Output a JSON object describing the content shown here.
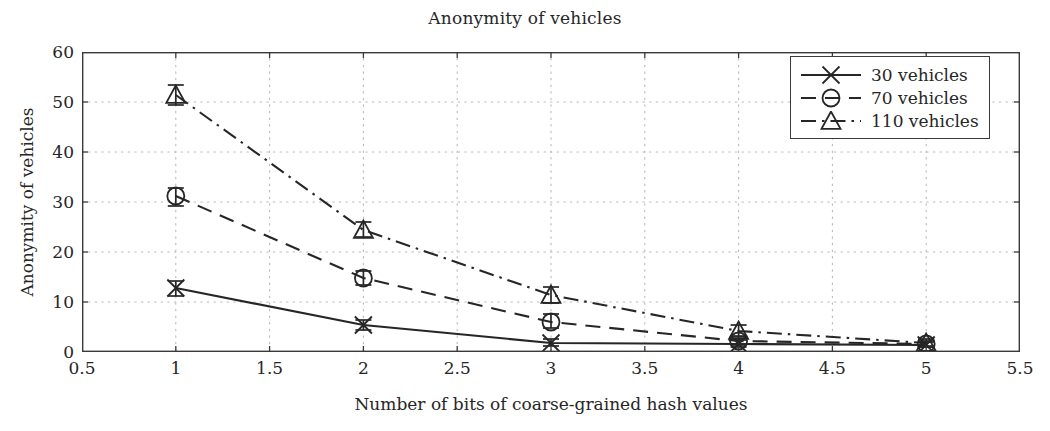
{
  "chart_data": {
    "type": "line",
    "title": "Anonymity of vehicles",
    "xlabel": "Number of bits of coarse-grained hash values",
    "ylabel": "Anonymity of vehicles",
    "xlim": [
      0.5,
      5.5
    ],
    "ylim": [
      0,
      60
    ],
    "xticks": [
      "0.5",
      "1",
      "1.5",
      "2",
      "2.5",
      "3",
      "3.5",
      "4",
      "4.5",
      "5",
      "5.5"
    ],
    "yticks": [
      "0",
      "10",
      "20",
      "30",
      "40",
      "50",
      "60"
    ],
    "grid": true,
    "legend_position": "top-right",
    "x": [
      1,
      2,
      3,
      4,
      5
    ],
    "series": [
      {
        "name": "30 vehicles",
        "marker": "x",
        "linestyle": "solid",
        "color": "#262626",
        "values": [
          12.8,
          5.4,
          1.8,
          1.6,
          1.4
        ],
        "err_low": [
          11.2,
          4.4,
          1.2,
          1.0,
          1.0
        ],
        "err_high": [
          14.2,
          6.4,
          2.6,
          2.4,
          2.0
        ]
      },
      {
        "name": "70 vehicles",
        "marker": "circle",
        "linestyle": "dashed",
        "color": "#262626",
        "values": [
          31.2,
          14.8,
          6.0,
          2.2,
          1.6
        ],
        "err_low": [
          29.2,
          13.4,
          4.8,
          1.4,
          1.0
        ],
        "err_high": [
          32.8,
          16.2,
          7.6,
          3.2,
          2.2
        ]
      },
      {
        "name": "110 vehicles",
        "marker": "triangle",
        "linestyle": "dashdot",
        "color": "#262626",
        "values": [
          51.4,
          24.4,
          11.4,
          4.2,
          1.8
        ],
        "err_low": [
          49.4,
          23.0,
          9.8,
          3.0,
          1.2
        ],
        "err_high": [
          53.4,
          26.0,
          13.0,
          5.4,
          2.6
        ]
      }
    ]
  },
  "legend": {
    "items": [
      {
        "label": "30 vehicles"
      },
      {
        "label": "70 vehicles"
      },
      {
        "label": "110 vehicles"
      }
    ]
  },
  "colors": {
    "axis": "#3a3a3a",
    "grid": "#b9b9b9",
    "text": "#262626"
  }
}
